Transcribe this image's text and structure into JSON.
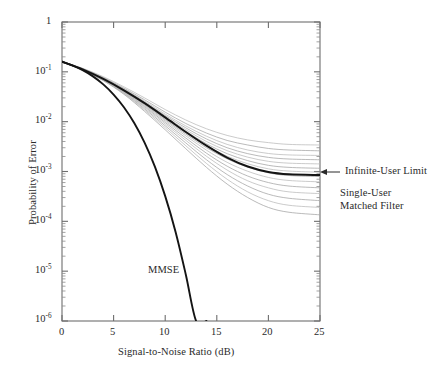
{
  "chart_data": {
    "type": "line",
    "title": "",
    "xlabel": "Signal-to-Noise Ratio (dB)",
    "ylabel": "Probability of Error",
    "xlim": [
      0,
      25
    ],
    "ylim": [
      1e-06,
      1
    ],
    "yscale": "log",
    "grid": false,
    "legend": "none",
    "xticks": [
      0,
      5,
      10,
      15,
      20,
      25
    ],
    "xtick_labels": [
      "0",
      "5",
      "10",
      "15",
      "20",
      "25"
    ],
    "yticks": [
      1,
      0.1,
      0.01,
      0.001,
      0.0001,
      1e-05,
      1e-06
    ],
    "ytick_labels": [
      "1",
      "10-1",
      "10-2",
      "10-3",
      "10-4",
      "10-5",
      "10-6"
    ],
    "annotations": [
      {
        "name": "infinite-user-limit",
        "text": "Infinite-User Limit",
        "x": 25,
        "y": 0.001,
        "arrow": true
      },
      {
        "name": "single-user-matched-filter",
        "line1": "Single-User",
        "line2": "Matched Filter",
        "x": 25,
        "y": 0.0004,
        "arrow": false
      },
      {
        "name": "mmse",
        "text": "MMSE",
        "x": 10.5,
        "y": 1.2e-05,
        "arrow": false
      }
    ],
    "series": [
      {
        "name": "MMSE",
        "style": "bold-black",
        "x": [
          0,
          1,
          2,
          3,
          4,
          5,
          6,
          7,
          8,
          9,
          10,
          11,
          12,
          13,
          14
        ],
        "y": [
          0.16,
          0.135,
          0.108,
          0.081,
          0.056,
          0.035,
          0.0195,
          0.0094,
          0.0038,
          0.00125,
          0.00032,
          6.2e-05,
          8.5e-06,
          9e-07,
          8e-08
        ]
      },
      {
        "name": "Infinite-User Limit",
        "style": "bold-black",
        "x": [
          0,
          2,
          4,
          6,
          8,
          10,
          12,
          14,
          16,
          18,
          20,
          22,
          25
        ],
        "y": [
          0.16,
          0.112,
          0.072,
          0.0425,
          0.0235,
          0.0122,
          0.0062,
          0.0033,
          0.0019,
          0.00126,
          0.00098,
          0.00088,
          0.00085
        ]
      },
      {
        "name": "Single-User Matched Filter (ensemble 1)",
        "style": "faint-gray",
        "x": [
          0,
          2,
          4,
          6,
          8,
          10,
          12,
          14,
          16,
          18,
          20,
          22,
          25
        ],
        "y": [
          0.162,
          0.118,
          0.08,
          0.05,
          0.03,
          0.0175,
          0.0108,
          0.0072,
          0.0053,
          0.0043,
          0.0038,
          0.0035,
          0.0034
        ]
      },
      {
        "name": "Single-User Matched Filter (ensemble 2)",
        "style": "faint-gray",
        "x": [
          0,
          2,
          4,
          6,
          8,
          10,
          12,
          14,
          16,
          18,
          20,
          22,
          25
        ],
        "y": [
          0.161,
          0.116,
          0.077,
          0.047,
          0.0275,
          0.0155,
          0.0092,
          0.0059,
          0.0042,
          0.0034,
          0.0029,
          0.0027,
          0.0026
        ]
      },
      {
        "name": "Single-User Matched Filter (ensemble 3)",
        "style": "faint-gray",
        "x": [
          0,
          2,
          4,
          6,
          8,
          10,
          12,
          14,
          16,
          18,
          20,
          22,
          25
        ],
        "y": [
          0.161,
          0.115,
          0.0755,
          0.0455,
          0.0258,
          0.0142,
          0.0082,
          0.0051,
          0.0035,
          0.0027,
          0.0023,
          0.00215,
          0.0021
        ]
      },
      {
        "name": "Single-User Matched Filter (ensemble 4)",
        "style": "faint-gray",
        "x": [
          0,
          2,
          4,
          6,
          8,
          10,
          12,
          14,
          16,
          18,
          20,
          22,
          25
        ],
        "y": [
          0.16,
          0.1145,
          0.0745,
          0.0443,
          0.0246,
          0.0133,
          0.0075,
          0.0045,
          0.003,
          0.00228,
          0.00192,
          0.00178,
          0.00172
        ]
      },
      {
        "name": "Single-User Matched Filter (ensemble 5)",
        "style": "faint-gray",
        "x": [
          0,
          2,
          4,
          6,
          8,
          10,
          12,
          14,
          16,
          18,
          20,
          22,
          25
        ],
        "y": [
          0.16,
          0.1138,
          0.0737,
          0.0433,
          0.0236,
          0.0125,
          0.0069,
          0.004,
          0.00262,
          0.00194,
          0.0016,
          0.00147,
          0.00142
        ]
      },
      {
        "name": "Single-User Matched Filter (ensemble 6)",
        "style": "faint-gray",
        "x": [
          0,
          2,
          4,
          6,
          8,
          10,
          12,
          14,
          16,
          18,
          20,
          22,
          25
        ],
        "y": [
          0.1598,
          0.1132,
          0.073,
          0.0426,
          0.0229,
          0.0119,
          0.0064,
          0.0036,
          0.00228,
          0.00165,
          0.00133,
          0.00121,
          0.00116
        ]
      },
      {
        "name": "Single-User Matched Filter (ensemble 7)",
        "style": "faint-gray",
        "x": [
          0,
          2,
          4,
          6,
          8,
          10,
          12,
          14,
          16,
          18,
          20,
          22,
          25
        ],
        "y": [
          0.1597,
          0.1127,
          0.0724,
          0.042,
          0.0223,
          0.0114,
          0.006,
          0.0033,
          0.00203,
          0.00143,
          0.00113,
          0.00102,
          0.00097
        ]
      },
      {
        "name": "Single-User Matched Filter (ensemble 8)",
        "style": "faint-gray",
        "x": [
          0,
          2,
          4,
          6,
          8,
          10,
          12,
          14,
          16,
          18,
          20,
          22,
          25
        ],
        "y": [
          0.1596,
          0.1122,
          0.0718,
          0.0414,
          0.0217,
          0.0109,
          0.00562,
          0.003,
          0.00179,
          0.00122,
          0.00094,
          0.00083,
          0.00079
        ]
      },
      {
        "name": "Single-User Matched Filter (ensemble 9)",
        "style": "faint-gray",
        "x": [
          0,
          2,
          4,
          6,
          8,
          10,
          12,
          14,
          16,
          18,
          20,
          22,
          25
        ],
        "y": [
          0.1594,
          0.1116,
          0.0711,
          0.0406,
          0.0209,
          0.0103,
          0.00518,
          0.00268,
          0.00153,
          0.00101,
          0.00076,
          0.00066,
          0.00062
        ]
      },
      {
        "name": "Single-User Matched Filter (ensemble 10)",
        "style": "faint-gray",
        "x": [
          0,
          2,
          4,
          6,
          8,
          10,
          12,
          14,
          16,
          18,
          20,
          22,
          25
        ],
        "y": [
          0.1592,
          0.111,
          0.0703,
          0.0397,
          0.02,
          0.00965,
          0.00468,
          0.00233,
          0.00128,
          0.00081,
          0.0006,
          0.00051,
          0.00047
        ]
      },
      {
        "name": "Single-User Matched Filter (ensemble 11)",
        "style": "faint-gray",
        "x": [
          0,
          2,
          4,
          6,
          8,
          10,
          12,
          14,
          16,
          18,
          20,
          22,
          25
        ],
        "y": [
          0.159,
          0.1104,
          0.0694,
          0.0387,
          0.0191,
          0.00898,
          0.00421,
          0.00202,
          0.00107,
          0.00065,
          0.00047,
          0.00039,
          0.00036
        ]
      },
      {
        "name": "Single-User Matched Filter (ensemble 12)",
        "style": "faint-gray",
        "x": [
          0,
          2,
          4,
          6,
          8,
          10,
          12,
          14,
          16,
          18,
          20,
          22,
          25
        ],
        "y": [
          0.1588,
          0.1097,
          0.0684,
          0.0376,
          0.0181,
          0.00827,
          0.00373,
          0.00172,
          0.00087,
          0.00051,
          0.00035,
          0.00029,
          0.00026
        ]
      },
      {
        "name": "Single-User Matched Filter (ensemble 13)",
        "style": "faint-gray",
        "x": [
          0,
          2,
          4,
          6,
          8,
          10,
          12,
          14,
          16,
          18,
          20,
          22,
          25
        ],
        "y": [
          0.1586,
          0.109,
          0.0675,
          0.0365,
          0.0171,
          0.00757,
          0.00328,
          0.00145,
          0.0007,
          0.00039,
          0.00026,
          0.00021,
          0.00019
        ]
      },
      {
        "name": "Single-User Matched Filter (ensemble 14)",
        "style": "faint-gray",
        "x": [
          0,
          2,
          4,
          6,
          8,
          10,
          12,
          14,
          16,
          18,
          20,
          22,
          25
        ],
        "y": [
          0.1584,
          0.1083,
          0.0665,
          0.0354,
          0.0161,
          0.00688,
          0.00286,
          0.00121,
          0.00056,
          0.0003,
          0.00019,
          0.000152,
          0.000135
        ]
      }
    ]
  },
  "axis": {
    "x_title": "Signal-to-Noise Ratio (dB)",
    "y_title": "Probability of Error",
    "x_labels": [
      "0",
      "5",
      "10",
      "15",
      "20",
      "25"
    ],
    "y_labels": [
      {
        "mantissa": "1",
        "exp": ""
      },
      {
        "mantissa": "10",
        "exp": "-1"
      },
      {
        "mantissa": "10",
        "exp": "-2"
      },
      {
        "mantissa": "10",
        "exp": "-3"
      },
      {
        "mantissa": "10",
        "exp": "-4"
      },
      {
        "mantissa": "10",
        "exp": "-5"
      },
      {
        "mantissa": "10",
        "exp": "-6"
      }
    ]
  },
  "labels": {
    "infinite_user_limit": "Infinite-User Limit",
    "single_user_line1": "Single-User",
    "single_user_line2": "Matched Filter",
    "mmse": "MMSE"
  },
  "colors": {
    "background": "#ffffff",
    "axis": "#6e6e6e",
    "bold_curve": "#141414",
    "faint_curve": "#b9b9b9",
    "text": "#2a2a2a"
  }
}
